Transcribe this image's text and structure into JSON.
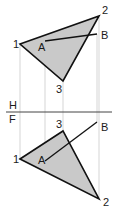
{
  "diagram": {
    "type": "orthographic-projection",
    "fill_color": "#c9c9c9",
    "edge_color": "#111111",
    "projection_line_color": "#b8b8b8",
    "fold_line": {
      "y": 112,
      "x1": 6,
      "x2": 112,
      "upper_label": "H",
      "lower_label": "F"
    },
    "top_view": {
      "triangle": {
        "p1": {
          "label": "1",
          "x": 20,
          "y": 44,
          "label_x": 13,
          "label_y": 48
        },
        "p2": {
          "label": "2",
          "x": 99,
          "y": 16,
          "label_x": 102,
          "label_y": 14
        },
        "p3": {
          "label": "3",
          "x": 63,
          "y": 81,
          "label_x": 56,
          "label_y": 93
        }
      },
      "line": {
        "a": {
          "label": "A",
          "x": 45,
          "y": 41,
          "label_x": 38,
          "label_y": 51
        },
        "b": {
          "label": "B",
          "x": 97,
          "y": 34,
          "label_x": 101,
          "label_y": 39
        }
      }
    },
    "front_view": {
      "triangle": {
        "p1": {
          "label": "1",
          "x": 20,
          "y": 159,
          "label_x": 13,
          "label_y": 163
        },
        "p2": {
          "label": "2",
          "x": 99,
          "y": 199,
          "label_x": 103,
          "label_y": 206
        },
        "p3": {
          "label": "3",
          "x": 63,
          "y": 131,
          "label_x": 56,
          "label_y": 128
        },
        "fill_color": "#c9c9c9"
      },
      "line": {
        "a": {
          "label": "A",
          "x": 45,
          "y": 161,
          "label_x": 38,
          "label_y": 164
        },
        "b": {
          "label": "B",
          "x": 97,
          "y": 122,
          "label_x": 101,
          "label_y": 131
        }
      }
    },
    "projection_lines": [
      {
        "x": 20,
        "y1": 44,
        "y2": 159
      },
      {
        "x": 45,
        "y1": 41,
        "y2": 161
      },
      {
        "x": 63,
        "y1": 81,
        "y2": 131
      },
      {
        "x": 97,
        "y1": 34,
        "y2": 122
      },
      {
        "x": 99,
        "y1": 16,
        "y2": 199
      }
    ]
  }
}
